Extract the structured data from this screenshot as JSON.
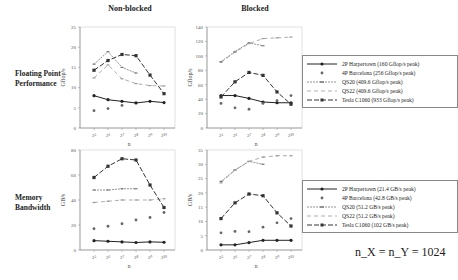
{
  "column_titles": [
    "Non-blocked",
    "Blocked"
  ],
  "row_titles": [
    "Floating Point Performance",
    "Memory Bandwidth"
  ],
  "note": "n_X = n_Y = 1024",
  "legends": [
    {
      "items": [
        "2P Harpertown (160 Gflop/s peak)",
        "4P Barcelona (256 Gflop/s peak)",
        "QS20 (409.6 Gflop/s peak)",
        "QS22 (409.6 Gflop/s peak)",
        "Tesla C1060 (933 Gflop/s peak)"
      ]
    },
    {
      "items": [
        "2P Harpertown (21.4 GB/s peak)",
        "4P Barcelona (42.8 GB/s peak)",
        "QS20 (51.2 GB/s peak)",
        "QS22 (51.2 GB/s peak)",
        "Tesla C1060 (102 GB/s peak)"
      ]
    }
  ],
  "chart_data": [
    {
      "type": "line",
      "title": "Non-blocked",
      "row": "Floating Point Performance",
      "xlabel": "n",
      "ylabel": "Gflop/s",
      "x": [
        "2^5",
        "2^6",
        "2^7",
        "2^8",
        "2^9",
        "2^10"
      ],
      "ylim": [
        0,
        25
      ],
      "yticks": [
        0,
        5,
        10,
        15,
        20,
        25
      ],
      "series": [
        {
          "name": "2P Harpertown",
          "values": [
            8.0,
            7.0,
            6.6,
            6.2,
            6.6,
            6.3
          ]
        },
        {
          "name": "4P Barcelona",
          "values": [
            4.3,
            4.8,
            5.6,
            null,
            null,
            null
          ]
        },
        {
          "name": "QS20",
          "values": [
            15.8,
            18.9,
            15.0,
            13.6,
            null,
            null
          ]
        },
        {
          "name": "QS22",
          "values": [
            12.4,
            15.6,
            12.2,
            11.0,
            10.5,
            10.4
          ]
        },
        {
          "name": "Tesla C1060",
          "values": [
            14.3,
            16.7,
            18.2,
            17.9,
            13.1,
            8.5
          ]
        }
      ]
    },
    {
      "type": "line",
      "title": "Blocked",
      "row": "Floating Point Performance",
      "xlabel": "n",
      "ylabel": "Gflop/s",
      "x": [
        "2^5",
        "2^6",
        "2^7",
        "2^8",
        "2^9",
        "2^10"
      ],
      "ylim": [
        0,
        140
      ],
      "yticks": [
        0,
        20,
        40,
        60,
        80,
        100,
        120,
        140
      ],
      "series": [
        {
          "name": "2P Harpertown",
          "values": [
            45,
            45,
            41,
            36,
            35,
            35
          ]
        },
        {
          "name": "4P Barcelona",
          "values": [
            34,
            28,
            26,
            34,
            38,
            45
          ]
        },
        {
          "name": "QS20",
          "values": [
            92,
            106,
            118,
            114,
            null,
            null
          ]
        },
        {
          "name": "QS22",
          "values": [
            91,
            105,
            117,
            124,
            125,
            126
          ]
        },
        {
          "name": "Tesla C1060",
          "values": [
            43,
            64,
            77,
            73,
            50,
            33
          ]
        }
      ]
    },
    {
      "type": "line",
      "title": "Non-blocked",
      "row": "Memory Bandwidth",
      "xlabel": "n",
      "ylabel": "GB/s",
      "x": [
        "2^5",
        "2^6",
        "2^7",
        "2^8",
        "2^9",
        "2^10"
      ],
      "ylim": [
        0,
        80
      ],
      "yticks": [
        0,
        20,
        40,
        60,
        80
      ],
      "series": [
        {
          "name": "2P Harpertown",
          "values": [
            7.5,
            7.0,
            6.5,
            6.0,
            6.5,
            6.2
          ]
        },
        {
          "name": "4P Barcelona",
          "values": [
            17,
            19,
            21,
            24,
            26,
            30
          ]
        },
        {
          "name": "QS20",
          "values": [
            48,
            48,
            49,
            49,
            null,
            null
          ]
        },
        {
          "name": "QS22",
          "values": [
            38,
            39,
            40,
            40,
            40,
            41
          ]
        },
        {
          "name": "Tesla C1060",
          "values": [
            58,
            67,
            73,
            72,
            52,
            34
          ]
        }
      ]
    },
    {
      "type": "line",
      "title": "Blocked",
      "row": "Memory Bandwidth",
      "xlabel": "n",
      "ylabel": "GB/s",
      "x": [
        "2^5",
        "2^6",
        "2^7",
        "2^8",
        "2^9",
        "2^10"
      ],
      "ylim": [
        0,
        35
      ],
      "yticks": [
        0,
        5,
        10,
        15,
        20,
        25,
        30,
        35
      ],
      "series": [
        {
          "name": "2P Harpertown",
          "values": [
            1.8,
            1.8,
            2.6,
            3.4,
            3.4,
            3.4
          ]
        },
        {
          "name": "4P Barcelona",
          "values": [
            6.0,
            6.5,
            6.4,
            8.0,
            9.5,
            11.0
          ]
        },
        {
          "name": "QS20",
          "values": [
            24,
            28,
            31,
            30,
            null,
            null
          ]
        },
        {
          "name": "QS22",
          "values": [
            23.5,
            28,
            31,
            32.5,
            33,
            33
          ]
        },
        {
          "name": "Tesla C1060",
          "values": [
            11,
            16.5,
            19.6,
            19,
            13,
            8.4
          ]
        }
      ]
    }
  ]
}
